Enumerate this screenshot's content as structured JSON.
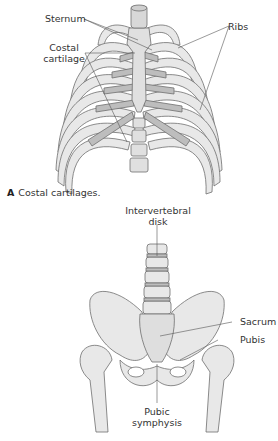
{
  "figure_a": {
    "labels": {
      "sternum": "Sternum",
      "ribs": "Ribs",
      "costal_cartilage_line1": "Costal",
      "costal_cartilage_line2": "cartilage"
    },
    "caption_letter": "A",
    "caption_text": "Costal cartilages."
  },
  "figure_b": {
    "labels": {
      "intervertebral_line1": "Intervertebral",
      "intervertebral_line2": "disk",
      "sacrum": "Sacrum",
      "pubis": "Pubis",
      "pubic_line1": "Pubic",
      "pubic_line2": "symphysis"
    }
  },
  "colors": {
    "bone": "#e8e8e8",
    "cartilage": "#bdbdbd",
    "outline": "#6e6e6e",
    "leader": "#555555"
  }
}
